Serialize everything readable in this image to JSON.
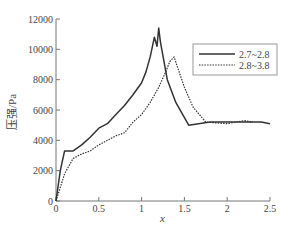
{
  "chart_data": {
    "type": "line",
    "title": "",
    "xlabel": "x",
    "ylabel": "压强/Pa",
    "xlim": [
      0,
      2.5
    ],
    "ylim": [
      0,
      12000
    ],
    "xticks": [
      0,
      0.5,
      1,
      1.5,
      2,
      2.5
    ],
    "xtick_labels": [
      "0",
      "0.5",
      "1",
      "1.5",
      "2",
      "2.5"
    ],
    "yticks": [
      0,
      2000,
      4000,
      6000,
      8000,
      10000,
      12000
    ],
    "ytick_labels": [
      "0",
      "2000",
      "4000",
      "6000",
      "8000",
      "10000",
      "12000"
    ],
    "grid": false,
    "legend_position": "upper right",
    "series": [
      {
        "name": "2.7~2.8",
        "style": "solid",
        "color": "#333333",
        "x": [
          0,
          0.05,
          0.1,
          0.2,
          0.3,
          0.4,
          0.5,
          0.6,
          0.7,
          0.8,
          0.9,
          1.0,
          1.05,
          1.1,
          1.15,
          1.18,
          1.2,
          1.22,
          1.3,
          1.4,
          1.55,
          1.8,
          2.0,
          2.2,
          2.4,
          2.5
        ],
        "values": [
          0,
          2000,
          3300,
          3300,
          3700,
          4200,
          4800,
          5100,
          5700,
          6300,
          7000,
          7800,
          8500,
          9500,
          10800,
          10200,
          11400,
          10500,
          8000,
          6500,
          5000,
          5200,
          5200,
          5200,
          5200,
          5100
        ]
      },
      {
        "name": "2.8~3.8",
        "style": "dotted",
        "color": "#333333",
        "x": [
          0,
          0.1,
          0.2,
          0.3,
          0.4,
          0.5,
          0.6,
          0.7,
          0.8,
          0.9,
          1.0,
          1.1,
          1.2,
          1.28,
          1.33,
          1.38,
          1.42,
          1.5,
          1.6,
          1.75,
          2.0,
          2.2,
          2.3
        ],
        "values": [
          0,
          1800,
          2800,
          3100,
          3300,
          3700,
          4000,
          4300,
          4500,
          5200,
          5700,
          6500,
          7500,
          8500,
          9200,
          9500,
          8800,
          7500,
          6200,
          5200,
          5100,
          5300,
          5200
        ]
      }
    ]
  },
  "legend": {
    "items": [
      {
        "label": "2.7~2.8",
        "style": "solid"
      },
      {
        "label": "2.8~3.8",
        "style": "dotted"
      }
    ]
  },
  "axes": {
    "xlabel": "x",
    "ylabel": "压强/Pa"
  }
}
